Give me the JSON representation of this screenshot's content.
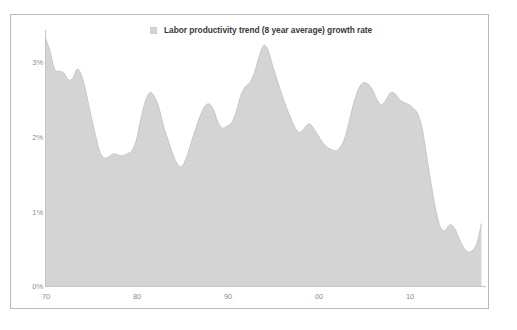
{
  "chart_data": {
    "type": "area",
    "title": "",
    "subtitle": "",
    "xlabel": "",
    "ylabel": "",
    "legend": [
      {
        "name": "Labor productivity trend (8 year average) growth rate",
        "color": "#d4d4d4",
        "marker": "legend-swatch"
      }
    ],
    "legend_position": "top-center",
    "grid": false,
    "series_name": "Labor productivity trend (8 year average) growth rate",
    "series_color": "#d4d4d4",
    "series_line_color": "#c3c3c3",
    "xlim": [
      1970,
      2018.5
    ],
    "ylim": [
      0,
      3.6
    ],
    "yticks": [
      0,
      1,
      2,
      3
    ],
    "ytick_labels": [
      "0%",
      "1%",
      "2%",
      "3%"
    ],
    "xticks": [
      1970,
      1980,
      1990,
      2000,
      2010
    ],
    "xtick_labels": [
      "70",
      "80",
      "90",
      "00",
      "10"
    ],
    "units": "percent",
    "x": [
      1970,
      1970.5,
      1971,
      1971.5,
      1972,
      1972.5,
      1973,
      1973.5,
      1974,
      1974.5,
      1975,
      1975.5,
      1976,
      1976.5,
      1977,
      1977.5,
      1978,
      1978.5,
      1979,
      1979.5,
      1980,
      1980.5,
      1981,
      1981.5,
      1982,
      1982.5,
      1983,
      1983.5,
      1984,
      1984.5,
      1985,
      1985.5,
      1986,
      1986.5,
      1987,
      1987.5,
      1988,
      1988.5,
      1989,
      1989.5,
      1990,
      1990.5,
      1991,
      1991.5,
      1992,
      1992.5,
      1993,
      1993.5,
      1994,
      1994.5,
      1995,
      1995.5,
      1996,
      1996.5,
      1997,
      1997.5,
      1998,
      1998.5,
      1999,
      1999.5,
      2000,
      2000.5,
      2001,
      2001.5,
      2002,
      2002.5,
      2003,
      2003.5,
      2004,
      2004.5,
      2005,
      2005.5,
      2006,
      2006.5,
      2007,
      2007.5,
      2008,
      2008.5,
      2009,
      2009.5,
      2010,
      2010.5,
      2011,
      2011.5,
      2012,
      2012.5,
      2013,
      2013.5,
      2014,
      2014.5,
      2015,
      2015.5,
      2016,
      2016.5,
      2017,
      2017.5,
      2018
    ],
    "values": [
      3.49,
      3.3,
      3.05,
      3.02,
      3.0,
      2.9,
      2.92,
      3.05,
      2.95,
      2.7,
      2.4,
      2.12,
      1.88,
      1.8,
      1.82,
      1.86,
      1.84,
      1.83,
      1.86,
      1.9,
      2.05,
      2.35,
      2.6,
      2.72,
      2.66,
      2.5,
      2.25,
      2.05,
      1.86,
      1.72,
      1.68,
      1.8,
      2.0,
      2.2,
      2.38,
      2.52,
      2.56,
      2.48,
      2.3,
      2.22,
      2.25,
      2.3,
      2.45,
      2.68,
      2.8,
      2.86,
      3.0,
      3.22,
      3.38,
      3.32,
      3.1,
      2.9,
      2.7,
      2.52,
      2.36,
      2.22,
      2.16,
      2.22,
      2.28,
      2.22,
      2.12,
      2.02,
      1.95,
      1.92,
      1.9,
      1.96,
      2.1,
      2.35,
      2.6,
      2.78,
      2.86,
      2.84,
      2.76,
      2.62,
      2.55,
      2.62,
      2.72,
      2.7,
      2.62,
      2.58,
      2.55,
      2.5,
      2.42,
      2.2,
      1.8,
      1.4,
      1.05,
      0.82,
      0.78,
      0.86,
      0.82,
      0.68,
      0.55,
      0.48,
      0.5,
      0.6,
      0.88
    ]
  },
  "axes": {
    "y_labels": [
      "3%",
      "2%",
      "1%",
      "0%"
    ],
    "x_labels": [
      "70",
      "80",
      "90",
      "00",
      "10"
    ]
  }
}
